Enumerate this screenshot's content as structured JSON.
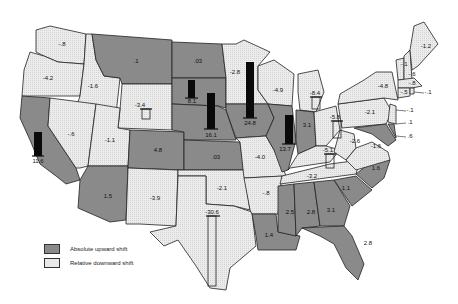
{
  "legend": {
    "items": [
      {
        "label": "Absolute upward shift",
        "style": "up",
        "color": "#8a8a8a"
      },
      {
        "label": "Relative downward shift",
        "style": "down",
        "color": "#e8e8e8"
      }
    ]
  },
  "states": [
    {
      "name": "WA",
      "value": "-.8",
      "shift": "down"
    },
    {
      "name": "OR",
      "value": "-4.2",
      "shift": "down"
    },
    {
      "name": "ID",
      "value": "-1.6",
      "shift": "down"
    },
    {
      "name": "MT",
      "value": ".1",
      "shift": "up"
    },
    {
      "name": "WY",
      "value": "-3.4",
      "shift": "down"
    },
    {
      "name": "ND",
      "value": ".03",
      "shift": "up"
    },
    {
      "name": "SD",
      "value": "8.1",
      "shift": "up"
    },
    {
      "name": "NE",
      "value": "16.1",
      "shift": "up"
    },
    {
      "name": "MN",
      "value": "-2.8",
      "shift": "down"
    },
    {
      "name": "IA",
      "value": "24.8",
      "shift": "up"
    },
    {
      "name": "WI",
      "value": "-4.9",
      "shift": "down"
    },
    {
      "name": "MI",
      "value": "-8.4",
      "shift": "down"
    },
    {
      "name": "IL",
      "value": "13.7",
      "shift": "up"
    },
    {
      "name": "IN",
      "value": "3.1",
      "shift": "up"
    },
    {
      "name": "OH",
      "value": "-5.8",
      "shift": "down"
    },
    {
      "name": "CA",
      "value": "11.6",
      "shift": "up"
    },
    {
      "name": "NV",
      "value": "-.6",
      "shift": "down"
    },
    {
      "name": "UT",
      "value": "-1.1",
      "shift": "down"
    },
    {
      "name": "CO",
      "value": "4.8",
      "shift": "up"
    },
    {
      "name": "KS",
      "value": ".03",
      "shift": "up"
    },
    {
      "name": "MO",
      "value": "-4.0",
      "shift": "down"
    },
    {
      "name": "AZ",
      "value": "1.5",
      "shift": "up"
    },
    {
      "name": "NM",
      "value": "-3.9",
      "shift": "down"
    },
    {
      "name": "OK",
      "value": "-2.1",
      "shift": "down"
    },
    {
      "name": "AR",
      "value": "-.8",
      "shift": "down"
    },
    {
      "name": "TX",
      "value": "-30.6",
      "shift": "down"
    },
    {
      "name": "LA",
      "value": "1.4",
      "shift": "up"
    },
    {
      "name": "MS",
      "value": "2.5",
      "shift": "up"
    },
    {
      "name": "AL",
      "value": "2.8",
      "shift": "up"
    },
    {
      "name": "GA",
      "value": "3.1",
      "shift": "up"
    },
    {
      "name": "FL",
      "value": "2.8",
      "shift": "up"
    },
    {
      "name": "SC",
      "value": "1.1",
      "shift": "up"
    },
    {
      "name": "NC",
      "value": "1.6",
      "shift": "up"
    },
    {
      "name": "TN",
      "value": "-3.2",
      "shift": "down"
    },
    {
      "name": "KY",
      "value": "-5.1",
      "shift": "down"
    },
    {
      "name": "WV",
      "value": "-2.6",
      "shift": "down"
    },
    {
      "name": "VA",
      "value": "-1.6",
      "shift": "down"
    },
    {
      "name": "PA",
      "value": "-2.1",
      "shift": "down"
    },
    {
      "name": "NY",
      "value": "-4.8",
      "shift": "down"
    },
    {
      "name": "ME",
      "value": "-1.2",
      "shift": "down"
    },
    {
      "name": "VT",
      "value": "-.1",
      "shift": "down"
    },
    {
      "name": "NH",
      "value": "-.6",
      "shift": "down"
    },
    {
      "name": "MA",
      "value": "-.8",
      "shift": "down"
    },
    {
      "name": "CT",
      "value": "-.5",
      "shift": "down"
    },
    {
      "name": "RI",
      "value": "-.1",
      "shift": "down"
    },
    {
      "name": "NJ",
      "value": "-.1",
      "shift": "down"
    },
    {
      "name": "DE",
      "value": ".1",
      "shift": "up"
    },
    {
      "name": "MD",
      "value": ".6",
      "shift": "up"
    }
  ]
}
